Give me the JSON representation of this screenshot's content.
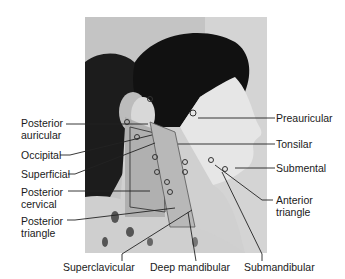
{
  "figure": {
    "labels_left": [
      {
        "id": "posterior-auricular",
        "line1": "Posterior",
        "line2": "auricular"
      },
      {
        "id": "occipital",
        "line1": "Occipital",
        "line2": ""
      },
      {
        "id": "superficial",
        "line1": "Superficial",
        "line2": ""
      },
      {
        "id": "posterior-cervical",
        "line1": "Posterior",
        "line2": "cervical"
      },
      {
        "id": "posterior-triangle",
        "line1": "Posterior",
        "line2": "triangle"
      }
    ],
    "labels_right": [
      {
        "id": "preauricular",
        "line1": "Preauricular",
        "line2": ""
      },
      {
        "id": "tonsilar",
        "line1": "Tonsilar",
        "line2": ""
      },
      {
        "id": "submental",
        "line1": "Submental",
        "line2": ""
      },
      {
        "id": "anterior-triangle",
        "line1": "Anterior",
        "line2": "triangle"
      }
    ],
    "labels_bottom": [
      {
        "id": "superclavicular",
        "line1": "Superclavicular"
      },
      {
        "id": "deep-mandibular",
        "line1": "Deep mandibular"
      },
      {
        "id": "submandibular",
        "line1": "Submandibular"
      }
    ]
  }
}
